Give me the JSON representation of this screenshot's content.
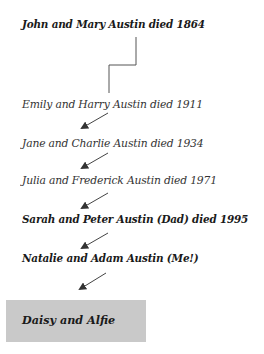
{
  "tree": {
    "generations": [
      {
        "label": "John and Mary Austin died 1864",
        "style": "bold"
      },
      {
        "label": "Emily and Harry Austin died 1911",
        "style": "normal"
      },
      {
        "label": "Jane and Charlie Austin died 1934",
        "style": "normal"
      },
      {
        "label": "Julia and Frederick Austin died 1971",
        "style": "normal"
      },
      {
        "label": "Sarah and Peter Austin (Dad) died 1995",
        "style": "bold"
      },
      {
        "label": "Natalie and Adam Austin (Me!)",
        "style": "bold"
      }
    ],
    "highlight": {
      "label": "Daisy and Alfie",
      "background": "#c9c9c9"
    }
  },
  "colors": {
    "line": "#444444",
    "text": "#1a1a1a",
    "box": "#c9c9c9"
  }
}
